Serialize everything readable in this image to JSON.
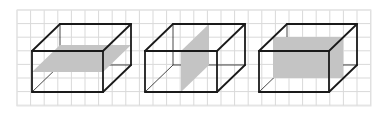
{
  "canvas": {
    "width": 387,
    "height": 115,
    "background": "#ffffff"
  },
  "grid": {
    "x0": 17,
    "y0": 10,
    "x1": 371,
    "y1": 106,
    "cell": 13.6,
    "color": "#d9d9d9",
    "border_color": "#e4e4e4"
  },
  "colors": {
    "edge": "#1a1a1a",
    "plane_fill": "#c4c4c4"
  },
  "boxes": [
    {
      "id": "box-horizontal-section",
      "front": {
        "x": 32,
        "y": 51,
        "w": 71,
        "h": 41
      },
      "depth": {
        "dx": 28,
        "dy": -27
      },
      "plane": [
        [
          32,
          72
        ],
        [
          103,
          72
        ],
        [
          131,
          45
        ],
        [
          60,
          45
        ]
      ]
    },
    {
      "id": "box-vertical-side-section",
      "front": {
        "x": 145,
        "y": 51,
        "w": 72,
        "h": 41
      },
      "depth": {
        "dx": 28,
        "dy": -27
      },
      "plane": [
        [
          181,
          51
        ],
        [
          181,
          92
        ],
        [
          209,
          65
        ],
        [
          209,
          24
        ]
      ]
    },
    {
      "id": "box-vertical-front-section",
      "front": {
        "x": 259,
        "y": 51,
        "w": 70,
        "h": 41
      },
      "depth": {
        "dx": 28,
        "dy": -27
      },
      "plane": [
        [
          273,
          37
        ],
        [
          343,
          37
        ],
        [
          343,
          78
        ],
        [
          273,
          78
        ]
      ]
    }
  ]
}
